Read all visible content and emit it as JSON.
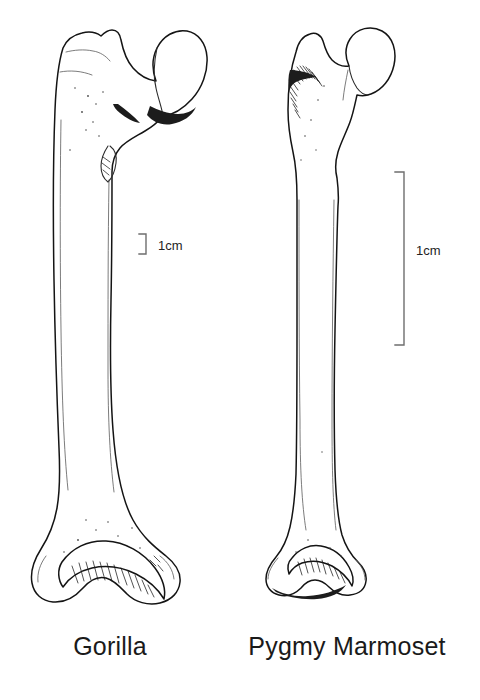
{
  "figure": {
    "type": "comparative-anatomy-illustration",
    "background_color": "#ffffff",
    "ink_color": "#1a1a1a"
  },
  "specimens": [
    {
      "id": "gorilla",
      "caption": "Gorilla",
      "caption_center_x": 110,
      "caption_baseline_y": 655,
      "bone": "femur",
      "view": "posterior",
      "drawn_length_px": 600,
      "scalebar": {
        "label": "1cm",
        "orientation": "vertical",
        "bracket_x": 146,
        "top_y": 234,
        "bottom_y": 254,
        "tick_length": 7,
        "label_x": 158,
        "label_baseline_y": 250
      }
    },
    {
      "id": "pygmy-marmoset",
      "caption": "Pygmy Marmoset",
      "caption_center_x": 347,
      "caption_baseline_y": 655,
      "bone": "femur",
      "view": "posterior",
      "drawn_length_px": 590,
      "scalebar": {
        "label": "1cm",
        "orientation": "vertical",
        "bracket_x": 404,
        "top_y": 172,
        "bottom_y": 345,
        "tick_length": 9,
        "label_x": 416,
        "label_baseline_y": 255
      }
    }
  ],
  "scale_note": {
    "gorilla_bar_px": 20,
    "marmoset_bar_px": 173,
    "meaning": "both bars represent 1 cm; the marmoset bar is longer because that bone is drawn at much greater magnification"
  }
}
